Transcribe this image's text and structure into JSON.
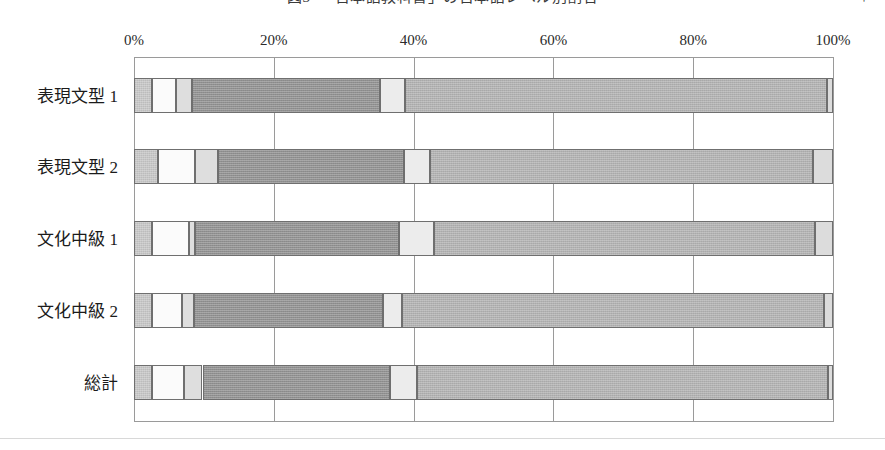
{
  "title": {
    "text": "図3　「日本語教科書」の日本語レベル別割合",
    "right_note": "＊"
  },
  "chart_data": {
    "type": "bar",
    "orientation": "horizontal",
    "stacked": true,
    "normalized_percent": true,
    "title": "図3　「日本語教科書」の日本語レベル別割合",
    "xlabel": "",
    "ylabel": "",
    "xlim": [
      0,
      100
    ],
    "xticks": [
      0,
      20,
      40,
      60,
      80,
      100
    ],
    "xtick_labels": [
      "0%",
      "20%",
      "40%",
      "60%",
      "80%",
      "100%"
    ],
    "grid": true,
    "legend": "none",
    "categories": [
      "表現文型 1",
      "表現文型 2",
      "文化中級 1",
      "文化中級 2",
      "総計"
    ],
    "series": [
      {
        "name": "区分1",
        "color": "#c6c6c6",
        "values": [
          2.6,
          3.4,
          2.6,
          2.6,
          2.6
        ]
      },
      {
        "name": "区分2",
        "color": "#fbfbfb",
        "values": [
          3.4,
          5.3,
          5.2,
          4.3,
          4.6
        ]
      },
      {
        "name": "区分3",
        "color": "#dedede",
        "values": [
          2.3,
          3.3,
          0.9,
          1.7,
          2.6
        ]
      },
      {
        "name": "区分4",
        "color": "#919191",
        "values": [
          26.9,
          26.6,
          29.2,
          27.0,
          26.8
        ]
      },
      {
        "name": "区分5",
        "color": "#ececec",
        "values": [
          3.6,
          3.7,
          5.0,
          2.7,
          3.9
        ]
      },
      {
        "name": "区分6",
        "color": "#b2b2b2",
        "values": [
          60.4,
          54.8,
          54.5,
          60.4,
          58.8
        ]
      },
      {
        "name": "区分7",
        "color": "#dcdcdc",
        "values": [
          0.9,
          2.9,
          2.6,
          1.3,
          0.7
        ]
      }
    ],
    "bar_geometry": [
      {
        "category": "表現文型 1",
        "top": 21,
        "stops": [
          0.0,
          2.6,
          6.0,
          8.3,
          35.2,
          38.8,
          99.1,
          100.0
        ]
      },
      {
        "category": "表現文型 2",
        "top": 92,
        "stops": [
          0.0,
          3.4,
          8.7,
          12.0,
          38.6,
          42.3,
          97.1,
          100.0
        ]
      },
      {
        "category": "文化中級 1",
        "top": 164,
        "stops": [
          0.0,
          2.6,
          7.8,
          8.7,
          37.9,
          42.9,
          97.4,
          100.0
        ]
      },
      {
        "category": "文化中級 2",
        "top": 236,
        "stops": [
          0.0,
          2.6,
          6.9,
          8.6,
          35.6,
          38.3,
          98.7,
          100.0
        ]
      },
      {
        "category": "総計",
        "top": 308,
        "stops": [
          0.0,
          2.6,
          7.2,
          9.8,
          36.6,
          40.5,
          99.3,
          100.0
        ]
      }
    ]
  }
}
